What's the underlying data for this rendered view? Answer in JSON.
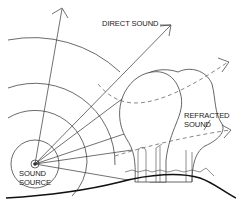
{
  "diagram": {
    "labels": {
      "direct_sound": "DIRECT SOUND",
      "refracted_sound_line1": "REFRACTED",
      "refracted_sound_line2": "SOUND",
      "sound_source_line1": "SOUND",
      "sound_source_line2": "SOURCE"
    },
    "elements": {
      "source": "sound-source point with concentric wavefronts",
      "wavefronts": 5,
      "direct_rays": 6,
      "refracted_rays": 2,
      "obstacle": "tree canopy with shrubs on hill"
    },
    "colors": {
      "line": "#333333",
      "ground": "#111111",
      "background": "#ffffff"
    }
  }
}
